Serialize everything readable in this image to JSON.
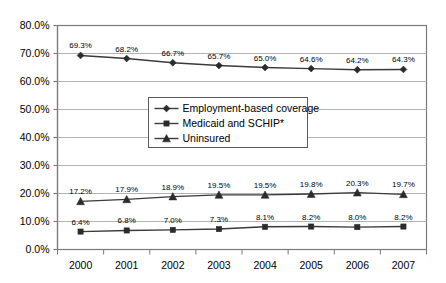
{
  "chart_data": {
    "type": "line",
    "title": "",
    "xlabel": "",
    "ylabel": "",
    "categories": [
      "2000",
      "2001",
      "2002",
      "2003",
      "2004",
      "2005",
      "2006",
      "2007"
    ],
    "ylim": [
      0,
      80
    ],
    "ytick_values": [
      0,
      10,
      20,
      30,
      40,
      50,
      60,
      70,
      80
    ],
    "ytick_labels": [
      "0.0%",
      "10.0%",
      "20.0%",
      "30.0%",
      "40.0%",
      "50.0%",
      "60.0%",
      "70.0%",
      "80.0%"
    ],
    "grid": "horizontal",
    "legend_position": "center",
    "series": [
      {
        "name": "Employment-based coverage",
        "marker": "diamond",
        "color": "#2b2b2b",
        "values": [
          69.3,
          68.2,
          66.7,
          65.7,
          65.0,
          64.6,
          64.2,
          64.3
        ],
        "labels": [
          "69.3%",
          "68.2%",
          "66.7%",
          "65.7%",
          "65.0%",
          "64.6%",
          "64.2%",
          "64.3%"
        ]
      },
      {
        "name": "Medicaid and SCHIP*",
        "marker": "square",
        "color": "#2b2b2b",
        "values": [
          6.4,
          6.8,
          7.0,
          7.3,
          8.1,
          8.2,
          8.0,
          8.2
        ],
        "labels": [
          "6.4%",
          "6.8%",
          "7.0%",
          "7.3%",
          "8.1%",
          "8.2%",
          "8.0%",
          "8.2%"
        ]
      },
      {
        "name": "Uninsured",
        "marker": "triangle",
        "color": "#2b2b2b",
        "values": [
          17.2,
          17.9,
          18.9,
          19.5,
          19.5,
          19.8,
          20.3,
          19.7
        ],
        "labels": [
          "17.2%",
          "17.9%",
          "18.9%",
          "19.5%",
          "19.5%",
          "19.8%",
          "20.3%",
          "19.7%"
        ]
      }
    ]
  }
}
